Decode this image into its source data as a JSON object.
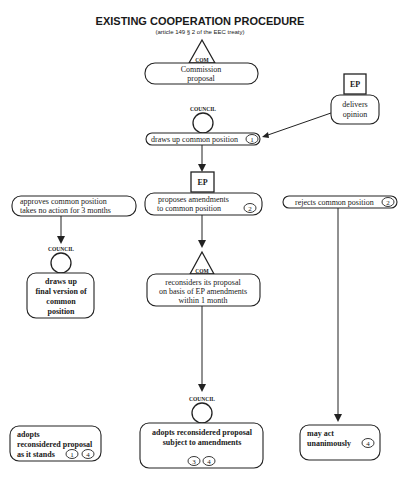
{
  "header": {
    "title": "EXISTING COOPERATION PROCEDURE",
    "subtitle": "(article 149 § 2 of the EEC treaty)"
  },
  "actors": {
    "commission": "COM",
    "council": "COUNCIL",
    "parliament": "EP"
  },
  "nodes": {
    "commission_proposal": {
      "lines": [
        "Commission",
        "proposal"
      ]
    },
    "ep_opinion": {
      "lines": [
        "delivers",
        "opinion"
      ]
    },
    "council_common_position": {
      "text": "draws up common position",
      "badge": "1"
    },
    "approves": {
      "lines": [
        "approves common position",
        "takes no action for 3 months"
      ]
    },
    "proposes_amendments": {
      "lines": [
        "proposes amendments",
        "to common position"
      ],
      "badge": "2"
    },
    "rejects": {
      "text": "rejects common position",
      "badge": "2"
    },
    "final_version": {
      "lines": [
        "draws up",
        "final version of",
        "common",
        "position"
      ]
    },
    "reconsiders": {
      "lines": [
        "reconsiders its proposal",
        "on basis of EP amendments",
        "within 1 month"
      ]
    },
    "adopts_as_is": {
      "lines": [
        "adopts",
        "reconsidered proposal",
        "as it stands"
      ],
      "badges": [
        "1",
        "4"
      ]
    },
    "adopts_amended": {
      "lines": [
        "adopts reconsidered proposal",
        "subject to amendments"
      ],
      "badges": [
        "3",
        "4"
      ]
    },
    "unanimous": {
      "lines": [
        "may act",
        "unanimously"
      ],
      "badge": "4"
    }
  }
}
